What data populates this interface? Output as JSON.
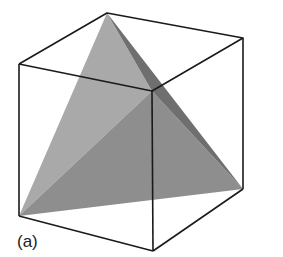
{
  "figure": {
    "label": "(a)",
    "colors": {
      "edge": "#1a1a1a",
      "face_light": "#a9a9a9",
      "face_mid": "#8e8e8e",
      "face_dark": "#6f6f6f",
      "background": "#ffffff"
    },
    "cube_vertices": {
      "top_back": [
        107,
        13
      ],
      "top_left": [
        19,
        64
      ],
      "top_right": [
        243,
        38
      ],
      "top_front": [
        152,
        91
      ],
      "bottom_left": [
        19,
        216
      ],
      "bottom_right": [
        243,
        189
      ],
      "bottom_front": [
        153,
        251
      ]
    },
    "tetrahedron_vertices": [
      "top_back",
      "top_front",
      "bottom_left",
      "bottom_right"
    ]
  }
}
